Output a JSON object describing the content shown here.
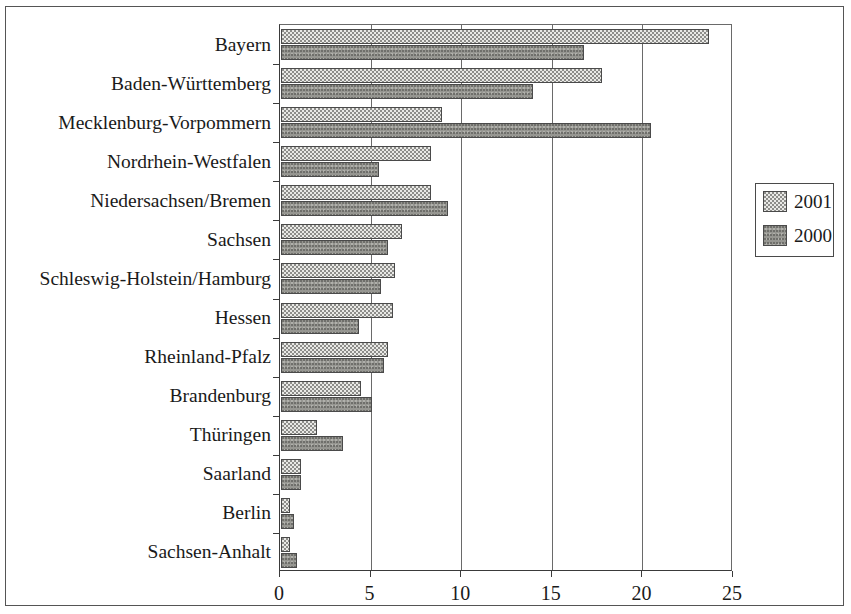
{
  "chart_data": {
    "type": "bar",
    "orientation": "horizontal",
    "title": "",
    "xlabel": "",
    "ylabel": "",
    "xlim": [
      0,
      25
    ],
    "xticks": [
      "0",
      "5",
      "10",
      "15",
      "20",
      "25"
    ],
    "grid": true,
    "legend_position": "right",
    "categories": [
      "Bayern",
      "Baden-Württemberg",
      "Mecklenburg-Vorpommern",
      "Nordrhein-Westfalen",
      "Niedersachsen/Bremen",
      "Sachsen",
      "Schleswig-Holstein/Hamburg",
      "Hessen",
      "Rheinland-Pfalz",
      "Brandenburg",
      "Thüringen",
      "Saarland",
      "Berlin",
      "Sachsen-Anhalt"
    ],
    "series": [
      {
        "name": "2001",
        "color": "#e9e9e6",
        "values": [
          23.6,
          17.7,
          8.9,
          8.3,
          8.3,
          6.7,
          6.3,
          6.2,
          5.9,
          4.4,
          2.0,
          1.1,
          0.5,
          0.5
        ]
      },
      {
        "name": "2000",
        "color": "#969691",
        "values": [
          16.7,
          13.9,
          20.4,
          5.4,
          9.2,
          5.9,
          5.5,
          4.3,
          5.7,
          5.0,
          3.4,
          1.1,
          0.7,
          0.9
        ]
      }
    ]
  },
  "legend": {
    "entries": [
      {
        "label": "2001"
      },
      {
        "label": "2000"
      }
    ]
  }
}
